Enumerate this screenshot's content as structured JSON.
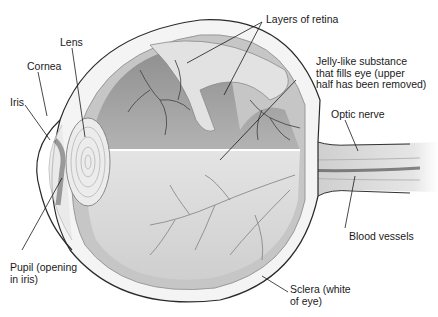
{
  "diagram": {
    "colors": {
      "background": "#ffffff",
      "outline": "#2a2a2a",
      "vitreous_upper": "#9a9a9a",
      "vitreous_lower": "#d6d6d6",
      "retina_band": "#bdbdbd",
      "vessel": "#555555",
      "leader_line": "#1a1a1a"
    },
    "labels": [
      {
        "id": "layers-of-retina",
        "lines": [
          "Layers of retina"
        ]
      },
      {
        "id": "lens",
        "lines": [
          "Lens"
        ]
      },
      {
        "id": "cornea",
        "lines": [
          "Cornea"
        ]
      },
      {
        "id": "jelly",
        "lines": [
          "Jelly-like substance",
          "that fills eye (upper",
          "half has been removed)"
        ]
      },
      {
        "id": "iris",
        "lines": [
          "Iris"
        ]
      },
      {
        "id": "optic-nerve",
        "lines": [
          "Optic nerve"
        ]
      },
      {
        "id": "blood-vessels",
        "lines": [
          "Blood vessels"
        ]
      },
      {
        "id": "pupil",
        "lines": [
          "Pupil (opening",
          "in iris)"
        ]
      },
      {
        "id": "sclera",
        "lines": [
          "Sclera (white",
          "of eye)"
        ]
      }
    ]
  }
}
